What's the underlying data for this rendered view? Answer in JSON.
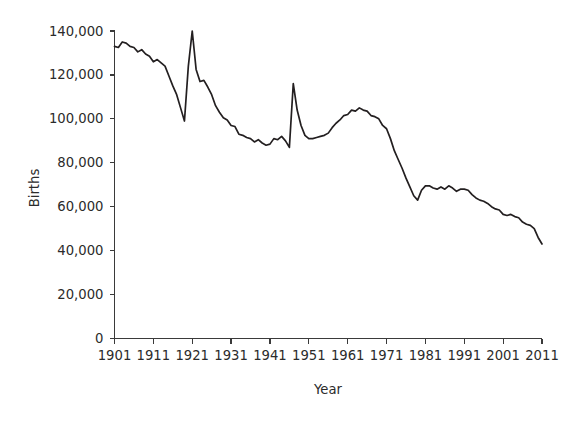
{
  "chart_data": {
    "type": "line",
    "title": "",
    "xlabel": "Year",
    "ylabel": "Births",
    "xlim": [
      1901,
      2011
    ],
    "ylim": [
      0,
      140000
    ],
    "grid": false,
    "legend": null,
    "y_ticks": [
      0,
      20000,
      40000,
      60000,
      80000,
      100000,
      120000,
      140000
    ],
    "y_tick_labels": [
      "0",
      "20,000",
      "40,000",
      "60,000",
      "80,000",
      "100,000",
      "120,000",
      "140,000"
    ],
    "x_ticks": [
      1901,
      1911,
      1921,
      1931,
      1941,
      1951,
      1961,
      1971,
      1981,
      1991,
      2001,
      2011
    ],
    "x_tick_labels": [
      "1901",
      "1911",
      "1921",
      "1931",
      "1941",
      "1951",
      "1961",
      "1971",
      "1981",
      "1991",
      "2001",
      "2011"
    ],
    "line_color": "#231f20",
    "series": [
      {
        "name": "Births",
        "x": [
          1901,
          1902,
          1903,
          1904,
          1905,
          1906,
          1907,
          1908,
          1909,
          1910,
          1911,
          1912,
          1913,
          1914,
          1915,
          1916,
          1917,
          1918,
          1919,
          1920,
          1921,
          1922,
          1923,
          1924,
          1925,
          1926,
          1927,
          1928,
          1929,
          1930,
          1931,
          1932,
          1933,
          1934,
          1935,
          1936,
          1937,
          1938,
          1939,
          1940,
          1941,
          1942,
          1943,
          1944,
          1945,
          1946,
          1947,
          1948,
          1949,
          1950,
          1951,
          1952,
          1953,
          1954,
          1955,
          1956,
          1957,
          1958,
          1959,
          1960,
          1961,
          1962,
          1963,
          1964,
          1965,
          1966,
          1967,
          1968,
          1969,
          1970,
          1971,
          1972,
          1973,
          1974,
          1975,
          1976,
          1977,
          1978,
          1979,
          1980,
          1981,
          1982,
          1983,
          1984,
          1985,
          1986,
          1987,
          1988,
          1989,
          1990,
          1991,
          1992,
          1993,
          1994,
          1995,
          1996,
          1997,
          1998,
          1999,
          2000,
          2001,
          2002,
          2003,
          2004,
          2005,
          2006,
          2007,
          2008,
          2009,
          2010,
          2011
        ],
        "values": [
          133000,
          132500,
          135000,
          134500,
          133000,
          132500,
          130500,
          131500,
          129500,
          128500,
          126000,
          127000,
          125500,
          124000,
          119500,
          115000,
          111000,
          105000,
          99000,
          124000,
          140000,
          122500,
          117000,
          117500,
          114500,
          111000,
          106000,
          103000,
          100500,
          99500,
          97000,
          96500,
          93000,
          92500,
          91500,
          91000,
          89500,
          90500,
          89000,
          88000,
          88500,
          91000,
          90500,
          92000,
          90000,
          87000,
          116000,
          104000,
          97000,
          92500,
          91000,
          91000,
          91500,
          92000,
          92500,
          93500,
          96000,
          98000,
          99500,
          101500,
          102000,
          104000,
          103500,
          105000,
          104000,
          103500,
          101500,
          101000,
          100000,
          97000,
          95500,
          91000,
          85500,
          81500,
          77500,
          73000,
          69000,
          65000,
          63000,
          67500,
          69500,
          69500,
          68500,
          68000,
          69000,
          68000,
          69500,
          68500,
          67000,
          68000,
          68000,
          67500,
          65500,
          64000,
          63000,
          62500,
          61500,
          60000,
          59000,
          58500,
          56500,
          56000,
          56500,
          55500,
          55000,
          53000,
          52000,
          51500,
          50000,
          46000,
          43000
        ]
      }
    ]
  },
  "axis": {
    "ylabel": "Births",
    "xlabel": "Year"
  }
}
